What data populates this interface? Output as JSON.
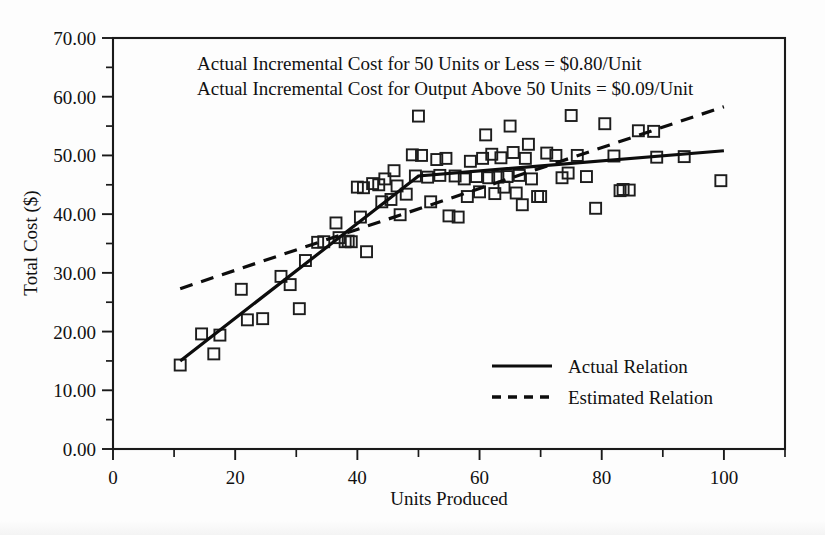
{
  "chart_data": {
    "type": "scatter",
    "title": "",
    "xlabel": "Units Produced",
    "ylabel": "Total Cost ($)",
    "xlim": [
      0,
      110
    ],
    "ylim": [
      0,
      70
    ],
    "grid": false,
    "x_ticks": [
      0,
      20,
      40,
      60,
      80,
      100
    ],
    "x_tick_labels": [
      "0",
      "20",
      "40",
      "60",
      "80",
      "100"
    ],
    "x_minor_ticks": [
      10,
      30,
      50,
      70,
      90,
      110
    ],
    "y_ticks": [
      0,
      10,
      20,
      30,
      40,
      50,
      60,
      70
    ],
    "y_tick_labels": [
      "0.00",
      "10.00",
      "20.00",
      "30.00",
      "40.00",
      "50.00",
      "60.00",
      "70.00"
    ],
    "y_minor_ticks": [
      5,
      15,
      25,
      35,
      45,
      55,
      65
    ],
    "annotations": [
      "Actual Incremental Cost for 50 Units or Less = $0.80/Unit",
      "Actual Incremental Cost for Output Above 50 Units = $0.09/Unit"
    ],
    "legend_position": "lower right",
    "legend": [
      {
        "label": "Actual Relation",
        "style": "solid"
      },
      {
        "label": "Estimated Relation",
        "style": "dashed"
      }
    ],
    "series": [
      {
        "name": "Actual Relation",
        "type": "line",
        "style": "solid",
        "points": [
          [
            11,
            15.0
          ],
          [
            50,
            46.5
          ],
          [
            100,
            50.8
          ]
        ]
      },
      {
        "name": "Estimated Relation",
        "type": "line",
        "style": "dashed",
        "points": [
          [
            11,
            27.3
          ],
          [
            100,
            58.3
          ]
        ]
      },
      {
        "name": "Observations",
        "type": "scatter",
        "marker": "open-square",
        "points": [
          [
            11.0,
            14.3
          ],
          [
            14.5,
            19.6
          ],
          [
            16.5,
            16.2
          ],
          [
            17.5,
            19.4
          ],
          [
            21.0,
            27.2
          ],
          [
            22.0,
            22.0
          ],
          [
            24.5,
            22.2
          ],
          [
            27.5,
            29.4
          ],
          [
            29.0,
            28.0
          ],
          [
            30.5,
            23.9
          ],
          [
            31.5,
            32.1
          ],
          [
            33.5,
            35.2
          ],
          [
            34.5,
            35.3
          ],
          [
            36.5,
            38.5
          ],
          [
            37.0,
            36.0
          ],
          [
            38.0,
            35.3
          ],
          [
            38.5,
            35.4
          ],
          [
            39.0,
            35.3
          ],
          [
            40.0,
            44.6
          ],
          [
            40.5,
            39.5
          ],
          [
            41.0,
            44.5
          ],
          [
            41.5,
            33.6
          ],
          [
            42.5,
            45.2
          ],
          [
            43.5,
            45.0
          ],
          [
            44.0,
            42.1
          ],
          [
            44.5,
            46.0
          ],
          [
            45.5,
            42.5
          ],
          [
            46.0,
            47.4
          ],
          [
            46.5,
            44.8
          ],
          [
            47.0,
            39.9
          ],
          [
            48.0,
            43.4
          ],
          [
            49.0,
            50.1
          ],
          [
            49.5,
            46.5
          ],
          [
            50.0,
            56.7
          ],
          [
            50.5,
            50.0
          ],
          [
            51.5,
            46.3
          ],
          [
            52.0,
            42.1
          ],
          [
            53.0,
            49.3
          ],
          [
            53.5,
            46.6
          ],
          [
            54.5,
            49.5
          ],
          [
            55.0,
            39.7
          ],
          [
            56.0,
            46.5
          ],
          [
            56.5,
            39.5
          ],
          [
            57.5,
            46.0
          ],
          [
            58.0,
            43.0
          ],
          [
            58.5,
            49.0
          ],
          [
            59.5,
            46.4
          ],
          [
            60.0,
            43.8
          ],
          [
            60.5,
            49.5
          ],
          [
            61.0,
            53.5
          ],
          [
            61.5,
            46.2
          ],
          [
            62.0,
            50.2
          ],
          [
            62.5,
            43.5
          ],
          [
            63.0,
            46.3
          ],
          [
            63.5,
            49.6
          ],
          [
            64.0,
            44.6
          ],
          [
            64.5,
            46.4
          ],
          [
            65.0,
            55.0
          ],
          [
            65.5,
            50.5
          ],
          [
            66.0,
            43.6
          ],
          [
            66.5,
            46.6
          ],
          [
            67.0,
            41.6
          ],
          [
            67.5,
            49.5
          ],
          [
            68.0,
            51.9
          ],
          [
            68.5,
            46.0
          ],
          [
            69.5,
            43.0
          ],
          [
            70.0,
            43.0
          ],
          [
            71.0,
            50.4
          ],
          [
            72.5,
            50.0
          ],
          [
            73.5,
            46.2
          ],
          [
            74.5,
            47.0
          ],
          [
            75.0,
            56.8
          ],
          [
            76.0,
            50.0
          ],
          [
            77.5,
            46.4
          ],
          [
            79.0,
            41.0
          ],
          [
            80.5,
            55.4
          ],
          [
            82.0,
            49.9
          ],
          [
            83.0,
            44.0
          ],
          [
            83.5,
            44.2
          ],
          [
            84.5,
            44.1
          ],
          [
            86.0,
            54.2
          ],
          [
            88.5,
            54.1
          ],
          [
            89.0,
            49.7
          ],
          [
            93.5,
            49.8
          ],
          [
            99.5,
            45.7
          ]
        ]
      }
    ]
  }
}
